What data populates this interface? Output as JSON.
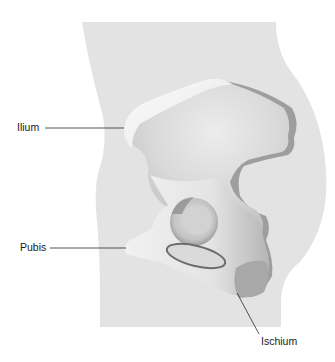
{
  "figure": {
    "colors": {
      "background": "#ffffff",
      "body_silhouette": "#e3e3e3",
      "bone_light": "#f4f4f4",
      "bone_mid": "#d6d6d6",
      "bone_shadow": "#9a9a9a",
      "leader_line": "#2a2a2a",
      "label_text": "#1a1a1a"
    }
  },
  "labels": [
    {
      "id": "ilium",
      "text": "Ilium"
    },
    {
      "id": "pubis",
      "text": "Pubis"
    },
    {
      "id": "ischium",
      "text": "Ischium"
    }
  ]
}
